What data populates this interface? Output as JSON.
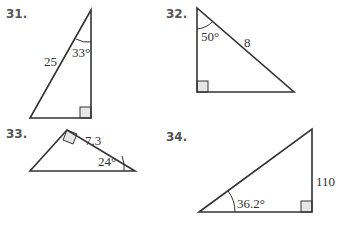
{
  "problems": [
    {
      "number": "31.",
      "hypotenuse": "25",
      "angle": "33°",
      "vertices": {
        "top": [
          91,
          10
        ],
        "bottom_left": [
          30,
          118
        ],
        "right_angle": [
          91,
          118
        ]
      }
    },
    {
      "number": "32.",
      "hypotenuse": "8",
      "angle": "50°",
      "vertices": {
        "top": [
          197,
          8
        ],
        "right_angle": [
          197,
          92
        ],
        "bottom_right": [
          294,
          92
        ]
      }
    },
    {
      "number": "33.",
      "side": "7.3",
      "angle": "24°",
      "vertices": {
        "right_angle": [
          67,
          130
        ],
        "bottom_left": [
          30,
          171
        ],
        "right": [
          135,
          171
        ]
      }
    },
    {
      "number": "34.",
      "side": "110",
      "angle": "36.2°",
      "vertices": {
        "left": [
          199,
          212
        ],
        "top_right": [
          312,
          129
        ],
        "right_angle": [
          312,
          212
        ]
      }
    }
  ],
  "colors": {
    "line": "#333333",
    "right_angle_fill": "#e6e6e6",
    "label_number": "#555555"
  }
}
